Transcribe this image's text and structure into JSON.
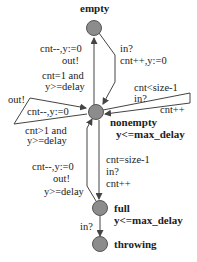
{
  "states": [
    {
      "id": "empty",
      "name": "empty",
      "invariant": ""
    },
    {
      "id": "nonempty",
      "name": "nonempty",
      "invariant": "y<=max_delay"
    },
    {
      "id": "full",
      "name": "full",
      "invariant": "y<=max_delay"
    },
    {
      "id": "throwing",
      "name": "throwing",
      "invariant": ""
    }
  ],
  "edges": {
    "nonempty_to_empty": {
      "update": "cnt--,y:=0",
      "sync": "out!",
      "guard_line1": "cnt=1 and",
      "guard_line2": "y>=delay"
    },
    "empty_to_nonempty": {
      "sync": "in?",
      "update": "cnt++,y:=0"
    },
    "nonempty_self_in": {
      "guard": "cnt<size-1",
      "sync": "in?",
      "update": "cnt++"
    },
    "nonempty_self_out": {
      "sync": "out!",
      "update": "cnt--,y:=0",
      "guard_line1": "cnt>1 and",
      "guard_line2": "y>=delay"
    },
    "full_to_nonempty": {
      "update": "cnt--,y:=0",
      "sync": "out!",
      "guard": "y>=delay"
    },
    "nonempty_to_full": {
      "guard": "cnt=size-1",
      "sync": "in?",
      "update": "cnt++"
    },
    "full_to_throwing": {
      "sync": "in?"
    }
  },
  "colors": {
    "node_fill": "#8c8c8c",
    "node_stroke": "#555555",
    "edge": "#444444"
  }
}
